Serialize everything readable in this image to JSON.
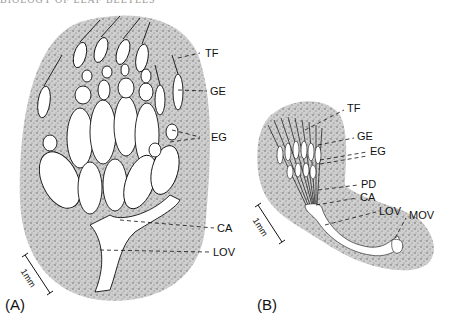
{
  "header": {
    "running_head": "BIOLOGY OF LEAF BEETLES"
  },
  "figure": {
    "panels": [
      {
        "id": "A",
        "label": "(A)",
        "scale_bar": "1mm",
        "annotations": [
          {
            "code": "TF"
          },
          {
            "code": "GE"
          },
          {
            "code": "EG"
          },
          {
            "code": "CA"
          },
          {
            "code": "LOV"
          }
        ]
      },
      {
        "id": "B",
        "label": "(B)",
        "scale_bar": "1mm",
        "annotations": [
          {
            "code": "TF"
          },
          {
            "code": "GE"
          },
          {
            "code": "EG"
          },
          {
            "code": "PD"
          },
          {
            "code": "CA"
          },
          {
            "code": "LOV"
          },
          {
            "code": "MOV"
          }
        ]
      }
    ]
  }
}
